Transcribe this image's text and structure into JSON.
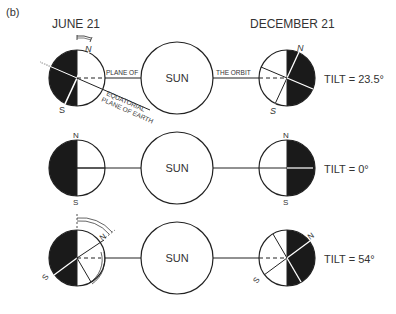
{
  "panel_label": "(b)",
  "headers": {
    "left": "JUNE 21",
    "right": "DECEMBER 21"
  },
  "sun_label": "SUN",
  "pole_labels": {
    "north": "N",
    "south": "S"
  },
  "annotations": {
    "plane_of": "PLANE OF",
    "the_orbit": "THE ORBIT",
    "equatorial": "EQUATORIAL",
    "plane_of_earth": "PLANE OF EARTH"
  },
  "rows": [
    {
      "tilt_label": "TILT = 23.5°",
      "tilt_deg": 23.5
    },
    {
      "tilt_label": "TILT = 0°",
      "tilt_deg": 0
    },
    {
      "tilt_label": "TILT = 54°",
      "tilt_deg": 54
    }
  ],
  "colors": {
    "ink": "#222222",
    "night": "#1a1a1a",
    "paper": "#ffffff"
  }
}
